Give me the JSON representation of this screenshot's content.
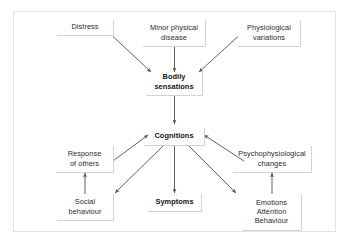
{
  "figure": {
    "border_color": "#e3e3e3",
    "node_border_color": "#d2d2d2",
    "arrow_color": "#58585a",
    "text_color": "#2b2b2b"
  },
  "nodes": [
    {
      "id": "distress",
      "label": "Distress",
      "bold": false
    },
    {
      "id": "minor-physical-disease",
      "label": "Minor physical\ndisease",
      "bold": false
    },
    {
      "id": "physiological-variations",
      "label": "Physiological\nvariations",
      "bold": false
    },
    {
      "id": "bodily-sensations",
      "label": "Bodily\nsensations",
      "bold": true
    },
    {
      "id": "cognitions",
      "label": "Cognitions",
      "bold": true
    },
    {
      "id": "response-of-others",
      "label": "Response\nof others",
      "bold": false
    },
    {
      "id": "psychophysiological-changes",
      "label": "Psychophysiological\nchanges",
      "bold": false
    },
    {
      "id": "social-behaviour",
      "label": "Social\nbehaviour",
      "bold": false
    },
    {
      "id": "symptoms",
      "label": "Symptoms",
      "bold": true
    },
    {
      "id": "emotions-attention-behaviour",
      "label": "Emotions\nAttention\nBehaviour",
      "bold": false
    }
  ],
  "edges": [
    {
      "from": "distress",
      "to": "bodily-sensations"
    },
    {
      "from": "minor-physical-disease",
      "to": "bodily-sensations"
    },
    {
      "from": "physiological-variations",
      "to": "bodily-sensations"
    },
    {
      "from": "bodily-sensations",
      "to": "cognitions"
    },
    {
      "from": "response-of-others",
      "to": "cognitions"
    },
    {
      "from": "psychophysiological-changes",
      "to": "cognitions"
    },
    {
      "from": "cognitions",
      "to": "social-behaviour"
    },
    {
      "from": "cognitions",
      "to": "symptoms"
    },
    {
      "from": "cognitions",
      "to": "emotions-attention-behaviour"
    },
    {
      "from": "social-behaviour",
      "to": "response-of-others"
    },
    {
      "from": "emotions-attention-behaviour",
      "to": "psychophysiological-changes"
    }
  ]
}
